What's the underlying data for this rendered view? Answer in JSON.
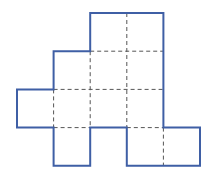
{
  "figure": {
    "name": "polyomino-net-figure",
    "title": "",
    "caption": "",
    "background_color": "#ffffff",
    "outline_color": "#3f5fa5",
    "grid_color": "#555555",
    "outline_width": 2,
    "grid_width": 1,
    "grid_dash": "4 3",
    "cell_width": 36.6,
    "cell_height": 38.2,
    "origin_x": 17,
    "origin_y": 13,
    "columns": 5,
    "rows": 4,
    "column_x": [
      17,
      53.6,
      90.2,
      126.8,
      163.4,
      200
    ],
    "row_y": [
      13,
      51.2,
      89.4,
      127.6,
      165.8
    ],
    "filled_cells": [
      [
        0,
        2
      ],
      [
        0,
        3
      ],
      [
        1,
        1
      ],
      [
        1,
        2
      ],
      [
        1,
        3
      ],
      [
        2,
        0
      ],
      [
        2,
        1
      ],
      [
        2,
        2
      ],
      [
        2,
        3
      ],
      [
        3,
        1
      ],
      [
        3,
        3
      ],
      [
        3,
        4
      ]
    ],
    "outline_path": "M126.8,13 L163.4,13 L163.4,127.6 L200,127.6 L200,165.8 L126.8,165.8 L126.8,127.6 L90.2,127.6 L90.2,165.8 L53.6,165.8 L53.6,127.6 L17,127.6 L17,89.4 L53.6,89.4 L53.6,51.2 L90.2,51.2 L90.2,13 Z",
    "interior_segments": [
      {
        "name": "v-line-col2-top",
        "x1": 126.8,
        "y1": 13,
        "x2": 126.8,
        "y2": 127.6
      },
      {
        "name": "v-line-col1",
        "x1": 90.2,
        "y1": 51.2,
        "x2": 90.2,
        "y2": 127.6
      },
      {
        "name": "v-line-col0",
        "x1": 53.6,
        "y1": 89.4,
        "x2": 53.6,
        "y2": 127.6
      },
      {
        "name": "v-line-col4-bottom",
        "x1": 163.4,
        "y1": 127.6,
        "x2": 163.4,
        "y2": 165.8
      },
      {
        "name": "h-line-row0",
        "x1": 90.2,
        "y1": 51.2,
        "x2": 163.4,
        "y2": 51.2
      },
      {
        "name": "h-line-row1",
        "x1": 53.6,
        "y1": 89.4,
        "x2": 163.4,
        "y2": 89.4
      },
      {
        "name": "h-line-row2",
        "x1": 53.6,
        "y1": 127.6,
        "x2": 90.2,
        "y2": 127.6
      },
      {
        "name": "h-line-row2b",
        "x1": 126.8,
        "y1": 127.6,
        "x2": 163.4,
        "y2": 127.6
      }
    ]
  }
}
